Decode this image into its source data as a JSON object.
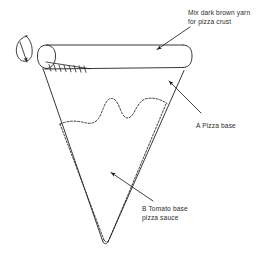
{
  "canvas": {
    "width": 267,
    "height": 255,
    "background": "#ffffff",
    "ink": "#231f20",
    "stroke_width": 0.9
  },
  "diagram": {
    "labels": [
      {
        "id": "crust",
        "name": "crust-label",
        "text": "Mix dark brown yarn\nfor pizza crust",
        "lines": [
          "Mix dark brown yarn",
          "for pizza crust"
        ],
        "x": 188,
        "y": 9,
        "leader": {
          "from": [
            190,
            27
          ],
          "to": [
            156,
            50
          ],
          "arrowhead": "filled"
        }
      },
      {
        "id": "base",
        "name": "pizza-base-label",
        "text": "A Pizza base",
        "lines": [
          "A Pizza base"
        ],
        "x": 196,
        "y": 122,
        "leader": {
          "from": [
            201,
            113
          ],
          "to": [
            168,
            80
          ],
          "arrowhead": "filled"
        }
      },
      {
        "id": "sauce",
        "name": "tomato-sauce-label",
        "text": "B Tomato base\npizza sauce",
        "lines": [
          "B Tomato base",
          "pizza sauce"
        ],
        "x": 142,
        "y": 205,
        "leader": {
          "from": [
            153,
            201
          ],
          "to": [
            110,
            172
          ],
          "arrowhead": "filled"
        }
      }
    ],
    "shapes": {
      "crust_tube": {
        "name": "pizza-crust-tube",
        "description": "horizontal rounded tube forming the crust",
        "left_x": 42,
        "right_x": 190,
        "top_y": 45,
        "bottom_y": 68,
        "cap_style": "rounded"
      },
      "slice_triangle": {
        "name": "pizza-base-triangle",
        "description": "tapering triangular slice body with rounded tip",
        "top_left": [
          43,
          68
        ],
        "top_right": [
          184,
          70
        ],
        "tip": [
          105,
          243
        ]
      },
      "sauce_edge": {
        "name": "tomato-sauce-wavy-edge",
        "description": "dashed wavy line marking the top of the tomato sauce",
        "style": "dashed",
        "left_point": [
          62,
          124
        ],
        "peaks": [
          [
            83,
            118
          ],
          [
            108,
            100
          ],
          [
            140,
            100
          ]
        ],
        "right_point": [
          167,
          103
        ]
      },
      "sauce_seam": {
        "name": "tomato-sauce-seam",
        "description": "dashed seam running just inside both lower edges down to the tip",
        "style": "dashed"
      },
      "stitch_row": {
        "name": "crust-stitch-row",
        "description": "row of small slanted stitch ticks along the crust seam",
        "count": 9,
        "start_x": 48,
        "end_x": 88,
        "y": 68
      },
      "yarn_loop": {
        "name": "yarn-loop",
        "description": "small teardrop yarn loop with arrow at far left",
        "cx": 25,
        "cy": 47,
        "rx": 9,
        "ry": 12,
        "arrow_to": [
          26,
          63
        ]
      }
    }
  }
}
